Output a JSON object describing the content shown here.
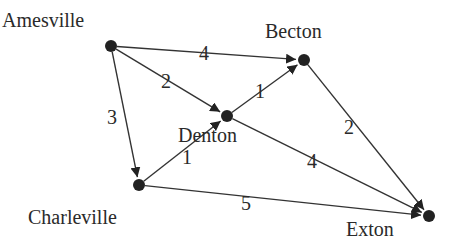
{
  "diagram": {
    "type": "directed-weighted-graph",
    "nodes": [
      {
        "id": "amesville",
        "label": "Amesville",
        "x": 111,
        "y": 46,
        "label_x": 2,
        "label_y": 27
      },
      {
        "id": "becton",
        "label": "Becton",
        "x": 304,
        "y": 60,
        "label_x": 265,
        "label_y": 38
      },
      {
        "id": "denton",
        "label": "Denton",
        "x": 227,
        "y": 116,
        "label_x": 178,
        "label_y": 142
      },
      {
        "id": "charleville",
        "label": "Charleville",
        "x": 139,
        "y": 185,
        "label_x": 28,
        "label_y": 224
      },
      {
        "id": "exton",
        "label": "Exton",
        "x": 429,
        "y": 216,
        "label_x": 346,
        "label_y": 236
      }
    ],
    "edges": [
      {
        "from": "amesville",
        "to": "becton",
        "weight": "4",
        "label_x": 204,
        "label_y": 60
      },
      {
        "from": "amesville",
        "to": "denton",
        "weight": "2",
        "label_x": 166,
        "label_y": 88
      },
      {
        "from": "amesville",
        "to": "charleville",
        "weight": "3",
        "label_x": 112,
        "label_y": 124
      },
      {
        "from": "denton",
        "to": "becton",
        "weight": "1",
        "label_x": 260,
        "label_y": 98
      },
      {
        "from": "charleville",
        "to": "denton",
        "weight": "1",
        "label_x": 187,
        "label_y": 164
      },
      {
        "from": "becton",
        "to": "exton",
        "weight": "2",
        "label_x": 349,
        "label_y": 134
      },
      {
        "from": "denton",
        "to": "exton",
        "weight": "4",
        "label_x": 312,
        "label_y": 168
      },
      {
        "from": "charleville",
        "to": "exton",
        "weight": "5",
        "label_x": 246,
        "label_y": 210
      }
    ]
  },
  "colors": {
    "node": "#222222",
    "edge": "#333333",
    "text": "#2a2a2a",
    "background": "#ffffff"
  }
}
